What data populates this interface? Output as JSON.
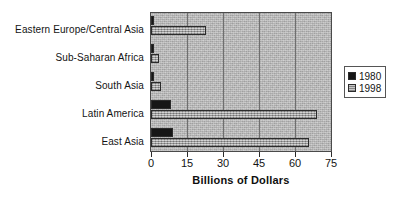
{
  "chart_data": {
    "type": "bar",
    "orientation": "horizontal",
    "title": "",
    "xlabel": "Billions of Dollars",
    "ylabel": "",
    "xlim": [
      0,
      75
    ],
    "xticks": [
      0,
      15,
      30,
      45,
      60,
      75
    ],
    "grid": true,
    "legend_position": "right",
    "categories": [
      "Eastern Europe/Central Asia",
      "Sub-Saharan Africa",
      "South Asia",
      "Latin America",
      "East Asia"
    ],
    "series": [
      {
        "name": "1980",
        "color": "#161616",
        "values": [
          1.0,
          1.0,
          1.0,
          8.5,
          9.0
        ]
      },
      {
        "name": "1998",
        "color": "#b0b0b0",
        "values": [
          23.0,
          3.5,
          4.0,
          69.0,
          66.0
        ]
      }
    ]
  },
  "axis": {
    "title": "Billions of Dollars",
    "tick_labels": [
      "0",
      "15",
      "30",
      "45",
      "60",
      "75"
    ]
  },
  "legend": {
    "items": [
      {
        "label": "1980",
        "swatch": "legend-swatch-1980"
      },
      {
        "label": "1998",
        "swatch": "legend-swatch-1998"
      }
    ]
  }
}
